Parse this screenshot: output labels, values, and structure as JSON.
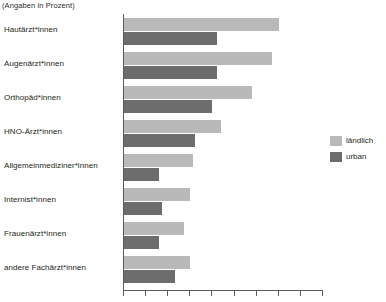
{
  "chart_data": {
    "type": "bar",
    "orientation": "horizontal",
    "title": "(Angaben in Prozent)",
    "xlabel": "",
    "ylabel": "",
    "xlim": [
      0,
      90
    ],
    "xticks": [
      0,
      10,
      20,
      30,
      40,
      50,
      60,
      70,
      80,
      90
    ],
    "grid": false,
    "legend_position": "right",
    "categories": [
      "Hautärzt*innen",
      "Augenärzt*innen",
      "Orthopäd*innen",
      "HNO-Ärzt*innen",
      "Allgemeinmediziner*innen",
      "Internist*innen",
      "Frauenärzt*innen",
      "andere Fachärzt*innen"
    ],
    "series": [
      {
        "name": "ländlich",
        "color": "#b9b9b9",
        "values": [
          70,
          67,
          58,
          44,
          31,
          30,
          27,
          30
        ]
      },
      {
        "name": "urban",
        "color": "#6d6d6d",
        "values": [
          42,
          42,
          40,
          32,
          16,
          17,
          16,
          23
        ]
      }
    ]
  },
  "legend": {
    "items": [
      {
        "label": "ländlich",
        "swatch": "rural"
      },
      {
        "label": "urban",
        "swatch": "urban"
      }
    ]
  }
}
